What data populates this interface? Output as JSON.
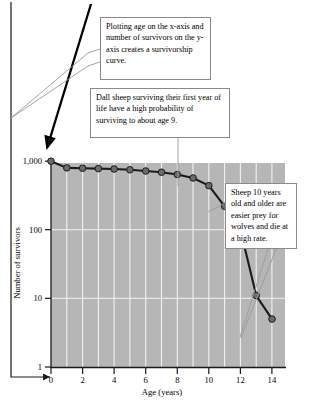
{
  "figure": {
    "plot_bg_color": "#b6b6b6",
    "gridline_color": "#f2f2f2",
    "curve_color": "#1a1a1a",
    "marker_color": "#6b6b6b",
    "callout_border_color": "#8a8a8a",
    "leader_color": "#9a9a9a",
    "arrow_color": "#000000"
  },
  "callouts": [
    {
      "id": "axes",
      "text": "Plotting age on the x-axis and number of survivors on the y-axis creates a survivorship curve."
    },
    {
      "id": "survival",
      "text": "Dall sheep surviving their first year of life have a high probability of surviving to about age 9."
    },
    {
      "id": "predation",
      "text": "Sheep 10 years old and older are easier prey for wolves and die at a high rate."
    }
  ],
  "chart_data": {
    "type": "line",
    "title": "",
    "xlabel": "Age (years)",
    "ylabel": "Number of survivors",
    "xlim": [
      0,
      15
    ],
    "ylim": [
      1,
      1000
    ],
    "yscale": "log",
    "xscale": "linear",
    "grid": true,
    "grid_orientation": "both",
    "legend": "none",
    "xticks": [
      0,
      2,
      4,
      6,
      8,
      10,
      12,
      14
    ],
    "xtick_labels": [
      "0",
      "2",
      "4",
      "6",
      "8",
      "10",
      "12",
      "14"
    ],
    "yticks": [
      1,
      10,
      100,
      1000
    ],
    "ytick_labels": [
      "1",
      "10",
      "100",
      "1,000"
    ],
    "x": [
      0,
      1,
      2,
      3,
      4,
      5,
      6,
      7,
      8,
      9,
      10,
      11,
      12,
      13,
      14
    ],
    "values": [
      1000,
      800,
      790,
      780,
      770,
      750,
      720,
      690,
      640,
      570,
      440,
      220,
      100,
      11,
      5
    ],
    "series_name": "Dall sheep survivors"
  }
}
